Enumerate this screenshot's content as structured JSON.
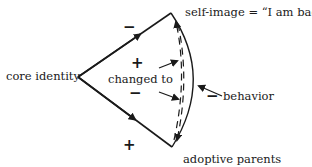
{
  "diagram": {
    "nodes": {
      "core_identity": "core identity",
      "self_image": "self-image = “I am bad”",
      "adoptive_parents": "adoptive parents",
      "changed_to": "changed to",
      "behavior": "behavior"
    },
    "signs": {
      "upper_edge_outer": "−",
      "upper_inner": "+",
      "lower_inner": "−",
      "lower_edge_outer": "+",
      "behavior_sign": "−"
    },
    "edges": [
      {
        "from": "core identity",
        "to": "self-image",
        "style": "solid",
        "arrow": "mid"
      },
      {
        "from": "core identity",
        "to": "adoptive parents",
        "style": "solid",
        "arrow": "mid"
      },
      {
        "from": "adoptive parents",
        "to": "self-image",
        "style": "dashed",
        "arrow": "end"
      },
      {
        "from": "self-image",
        "to": "adoptive parents",
        "style": "dashed",
        "arrow": "end"
      },
      {
        "from": "self-image",
        "to": "adoptive parents",
        "style": "solid-arc",
        "arrow": "none"
      }
    ],
    "colors": {
      "ink": "#1a1a1a",
      "background": "#ffffff"
    }
  }
}
